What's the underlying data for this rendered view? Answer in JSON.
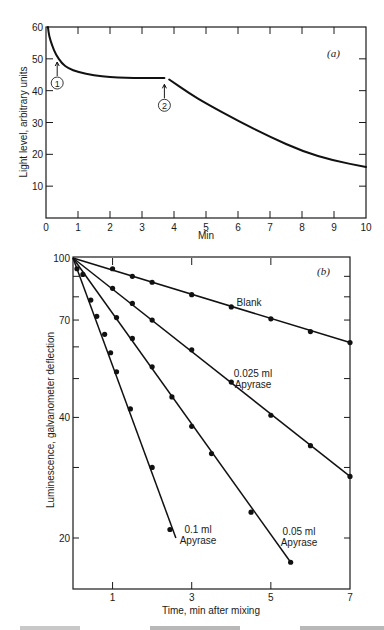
{
  "chart_data": [
    {
      "id": "a",
      "type": "line",
      "panel_label": "(a)",
      "title": "",
      "xlabel": "Min",
      "ylabel": "Light level, arbitrary units",
      "xlim": [
        0,
        10
      ],
      "ylim": [
        0,
        60
      ],
      "xticks": [
        0,
        1,
        2,
        3,
        4,
        5,
        6,
        7,
        8,
        9,
        10
      ],
      "yticks": [
        10,
        20,
        30,
        40,
        50,
        60
      ],
      "grid": false,
      "series": [
        {
          "name": "before addition 2",
          "x": [
            0.06,
            0.1,
            0.2,
            0.3,
            0.5,
            0.7,
            1.0,
            1.5,
            2.0,
            2.5,
            3.0,
            3.7
          ],
          "values": [
            60,
            57,
            54,
            51.5,
            48.5,
            47,
            45.8,
            44.8,
            44.3,
            44,
            44,
            44
          ]
        },
        {
          "name": "after addition 2",
          "x": [
            3.85,
            4.5,
            5,
            6,
            7,
            8,
            9,
            10
          ],
          "values": [
            43.5,
            39,
            36,
            30.5,
            25.5,
            21,
            18,
            16
          ]
        }
      ],
      "annotations": [
        {
          "label": "1",
          "x": 0.35,
          "y_arrow_tip": 49,
          "text": "addition 1 marker"
        },
        {
          "label": "2",
          "x": 3.7,
          "y_arrow_tip": 42,
          "text": "addition 2 marker"
        }
      ]
    },
    {
      "id": "b",
      "type": "scatter",
      "panel_label": "(b)",
      "title": "",
      "xlabel": "Time, min after mixing",
      "ylabel": "Luminescence, galvanometer deflection",
      "yscale": "log",
      "xlim": [
        0,
        7
      ],
      "ylim": [
        15,
        100
      ],
      "xticks": [
        1,
        3,
        5,
        7
      ],
      "yticks_labeled": [
        100,
        70,
        40,
        20
      ],
      "yticks_minor": [
        90,
        80,
        60,
        50,
        30
      ],
      "grid": false,
      "fit_lines": true,
      "series": [
        {
          "name": "Blank",
          "label_lines": [
            "Blank"
          ],
          "x": [
            1,
            1.5,
            2,
            3,
            4,
            5,
            6,
            7
          ],
          "values": [
            94,
            90,
            87,
            81,
            75.5,
            70.5,
            65.5,
            61.5
          ],
          "line": {
            "x0": 0,
            "y0": 100,
            "x1": 7,
            "y1": 61.5
          }
        },
        {
          "name": "0.025 ml Apyrase",
          "label_lines": [
            "0.025 ml",
            "Apyrase"
          ],
          "x": [
            1,
            1.5,
            2,
            3,
            4,
            5,
            6,
            7
          ],
          "values": [
            84,
            77,
            70,
            59,
            49,
            40.5,
            34,
            28.5
          ],
          "line": {
            "x0": 0,
            "y0": 100,
            "x1": 7,
            "y1": 28.5
          }
        },
        {
          "name": "0.05 ml Apyrase",
          "label_lines": [
            "0.05 ml",
            "Apyrase"
          ],
          "x": [
            0.25,
            1.1,
            1.5,
            2,
            2.5,
            3,
            3.5,
            4.5,
            5.5
          ],
          "values": [
            91,
            71,
            63,
            53.5,
            45,
            38,
            32.5,
            23.2,
            17.4
          ],
          "line": {
            "x0": 0,
            "y0": 100,
            "x1": 5.5,
            "y1": 17.4
          }
        },
        {
          "name": "0.1 ml Apyrase",
          "label_lines": [
            "0.1 ml",
            "Apyrase"
          ],
          "x": [
            0.1,
            0.45,
            0.6,
            0.8,
            0.95,
            1.1,
            1.45,
            2.0,
            2.45
          ],
          "values": [
            94,
            78.5,
            71.5,
            64.5,
            58,
            52,
            42,
            30,
            21
          ],
          "line": {
            "x0": 0,
            "y0": 100,
            "x1": 2.6,
            "y1": 20
          }
        }
      ]
    }
  ],
  "figure": {
    "panel_a_label": "(a)",
    "panel_b_label": "(b)",
    "annotation_1": "1",
    "annotation_2": "2"
  }
}
